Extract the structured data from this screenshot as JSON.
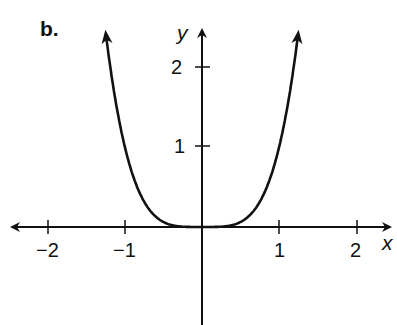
{
  "panel_label": "b.",
  "chart_data": {
    "type": "line",
    "title": "",
    "function": "y = x^4",
    "xlabel": "x",
    "ylabel": "y",
    "xlim": [
      -2.5,
      2.5
    ],
    "ylim": [
      -1.25,
      2.55
    ],
    "x_ticks": [
      -2,
      -1,
      1,
      2
    ],
    "x_tick_labels": [
      "−2",
      "−1",
      "1",
      "2"
    ],
    "y_ticks": [
      1,
      2
    ],
    "y_tick_labels": [
      "1",
      "2"
    ],
    "grid": false,
    "legend": null,
    "series": [
      {
        "name": "y = x^4",
        "x": [
          -1.26,
          -1.2,
          -1.1,
          -1.0,
          -0.9,
          -0.8,
          -0.7,
          -0.6,
          -0.5,
          -0.4,
          -0.3,
          -0.2,
          -0.1,
          0,
          0.1,
          0.2,
          0.3,
          0.4,
          0.5,
          0.6,
          0.7,
          0.8,
          0.9,
          1.0,
          1.1,
          1.2,
          1.26
        ],
        "y": [
          2.52,
          2.07,
          1.46,
          1.0,
          0.66,
          0.41,
          0.24,
          0.13,
          0.06,
          0.03,
          0.01,
          0.0,
          0.0,
          0,
          0.0,
          0.0,
          0.01,
          0.03,
          0.06,
          0.13,
          0.24,
          0.41,
          0.66,
          1.0,
          1.46,
          2.07,
          2.52
        ],
        "arrows_at_ends": true,
        "color": "#111111"
      }
    ]
  }
}
